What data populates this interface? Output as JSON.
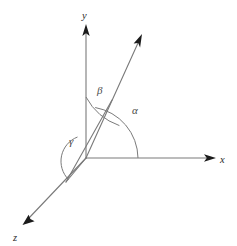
{
  "figure": {
    "background_color": "#ffffff",
    "line_color": "#7a7a7a",
    "arrow_color": "#1b1b1b",
    "label_color": "#2b2b2b",
    "angle_label_color": "#4a4a4a"
  },
  "axes": {
    "origin": {
      "x": 86,
      "y": 158
    },
    "x_axis": {
      "label": "x",
      "label_pos": {
        "x": 220,
        "y": 163
      },
      "tip": {
        "x": 215,
        "y": 158
      }
    },
    "y_axis": {
      "label": "y",
      "label_pos": {
        "x": 82,
        "y": 19
      },
      "tip": {
        "x": 86,
        "y": 25
      }
    },
    "z_axis": {
      "label": "z",
      "label_pos": {
        "x": 13,
        "y": 241
      },
      "tip": {
        "x": 23,
        "y": 224
      }
    }
  },
  "vector": {
    "label": "",
    "start": {
      "x": 86,
      "y": 158
    },
    "tip": {
      "x": 142,
      "y": 35
    }
  },
  "angles": [
    {
      "name": "alpha",
      "label": "α",
      "between": "vector and x-axis",
      "label_pos": {
        "x": 132,
        "y": 114
      },
      "radius": 52
    },
    {
      "name": "beta",
      "label": "β",
      "between": "vector and y-axis",
      "label_pos": {
        "x": 97,
        "y": 94
      },
      "radius": 61
    },
    {
      "name": "gamma",
      "label": "γ",
      "between": "vector and z-axis",
      "label_pos": {
        "x": 69,
        "y": 145
      },
      "radius": 24
    }
  ],
  "projection": {
    "foot": {
      "x": 66,
      "y": 182
    },
    "description": "projection of vector onto the z-axis direction"
  }
}
